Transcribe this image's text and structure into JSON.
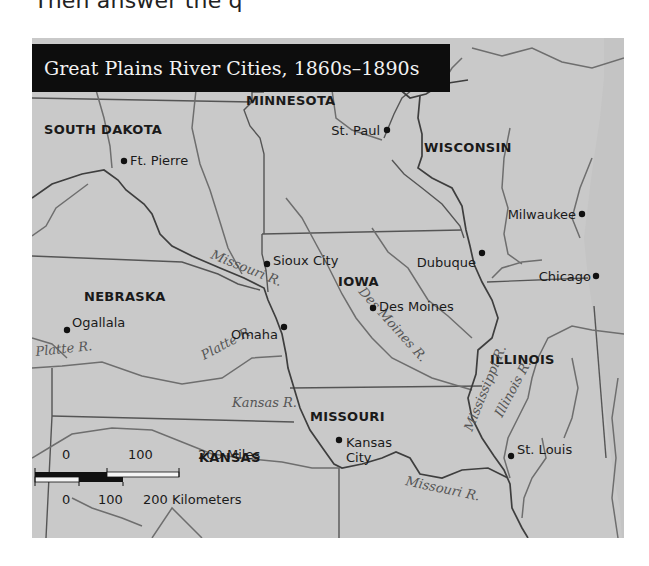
{
  "page": {
    "cutoff_text": "Then answer the q"
  },
  "map": {
    "title": "Great Plains River Cities, 1860s–1890s",
    "colors": {
      "land": "#c9c9c9",
      "title_bg": "#0d0d0d",
      "title_text": "#f2f2f2",
      "border": "#555555",
      "river": "#6e6e6e",
      "city_dot": "#111111"
    },
    "states": [
      {
        "name": "SOUTH DAKOTA",
        "x": 44,
        "y": 124
      },
      {
        "name": "MINNESOTA",
        "x": 246,
        "y": 95
      },
      {
        "name": "WISCONSIN",
        "x": 424,
        "y": 142
      },
      {
        "name": "IOWA",
        "x": 338,
        "y": 276
      },
      {
        "name": "NEBRASKA",
        "x": 84,
        "y": 291
      },
      {
        "name": "ILLINOIS",
        "x": 490,
        "y": 354
      },
      {
        "name": "MISSOURI",
        "x": 310,
        "y": 411
      },
      {
        "name": "KANSAS",
        "x": 199,
        "y": 452
      }
    ],
    "cities": [
      {
        "name": "Ft. Pierre",
        "dot_x": 92,
        "dot_y": 151,
        "label_x": 98,
        "label_y": 151,
        "anchor": "start"
      },
      {
        "name": "St. Paul",
        "dot_x": 355,
        "dot_y": 120,
        "label_x": 348,
        "label_y": 121,
        "anchor": "end"
      },
      {
        "name": "Milwaukee",
        "dot_x": 550,
        "dot_y": 204,
        "label_x": 544,
        "label_y": 205,
        "anchor": "end"
      },
      {
        "name": "Sioux City",
        "dot_x": 235,
        "dot_y": 254,
        "label_x": 241,
        "label_y": 251,
        "anchor": "start"
      },
      {
        "name": "Dubuque",
        "dot_x": 450,
        "dot_y": 243,
        "label_x": 444,
        "label_y": 253,
        "anchor": "end"
      },
      {
        "name": "Chicago",
        "dot_x": 564,
        "dot_y": 266,
        "label_x": 559,
        "label_y": 267,
        "anchor": "end"
      },
      {
        "name": "Des Moines",
        "dot_x": 341,
        "dot_y": 298,
        "label_x": 347,
        "label_y": 297,
        "anchor": "start"
      },
      {
        "name": "Omaha",
        "dot_x": 252,
        "dot_y": 317,
        "label_x": 246,
        "label_y": 325,
        "anchor": "end"
      },
      {
        "name": "Ogallala",
        "dot_x": 35,
        "dot_y": 320,
        "label_x": 40,
        "label_y": 313,
        "anchor": "start"
      },
      {
        "name": "Kansas City",
        "dot_x": 307,
        "dot_y": 430,
        "label_x": 314,
        "label_y": 441,
        "anchor": "start",
        "line2": "City",
        "line1": "Kansas"
      },
      {
        "name": "St. Louis",
        "dot_x": 479,
        "dot_y": 446,
        "label_x": 485,
        "label_y": 440,
        "anchor": "start"
      }
    ],
    "rivers": [
      {
        "name": "Missouri R.",
        "x": 178,
        "y": 248,
        "rotate": 22
      },
      {
        "name": "Platte R.",
        "x": 4,
        "y": 346,
        "rotate": -6
      },
      {
        "name": "Platte R.",
        "x": 172,
        "y": 350,
        "rotate": -28
      },
      {
        "name": "Des Moines R.",
        "x": 326,
        "y": 282,
        "rotate": 48
      },
      {
        "name": "Mississippi R.",
        "x": 440,
        "y": 422,
        "rotate": -68
      },
      {
        "name": "Illinois R.",
        "x": 470,
        "y": 408,
        "rotate": -62
      },
      {
        "name": "Kansas R.",
        "x": 200,
        "y": 397,
        "rotate": 0
      },
      {
        "name": "Missouri R.",
        "x": 373,
        "y": 475,
        "rotate": 12
      }
    ],
    "scale_bar": {
      "miles_labels": [
        "0",
        "100",
        "200 Miles"
      ],
      "km_labels": [
        "0",
        "100",
        "200 Kilometers"
      ]
    }
  }
}
